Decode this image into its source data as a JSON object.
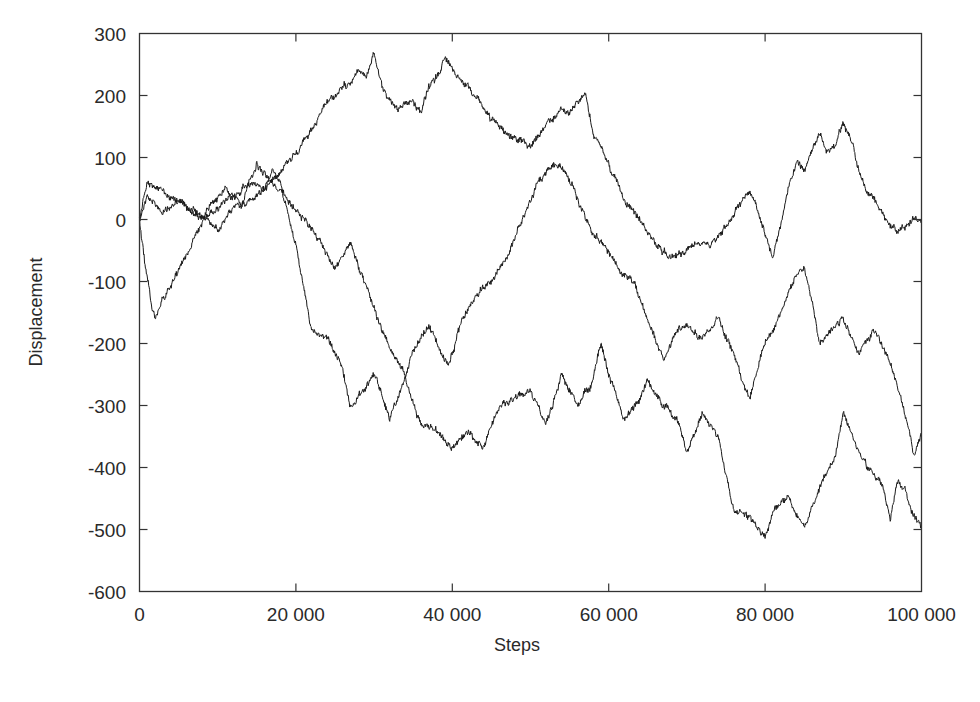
{
  "chart_data": {
    "type": "line",
    "title": "",
    "xlabel": "Steps",
    "ylabel": "Displacement",
    "xlim": [
      0,
      100000
    ],
    "ylim": [
      -600,
      300
    ],
    "grid": false,
    "legend": null,
    "x_ticks": [
      0,
      20000,
      40000,
      60000,
      80000,
      100000
    ],
    "x_tick_labels": [
      "0",
      "20 000",
      "40 000",
      "60 000",
      "80 000",
      "100 000"
    ],
    "y_ticks": [
      300,
      200,
      100,
      0,
      -100,
      -200,
      -300,
      -400,
      -500,
      -600
    ],
    "y_tick_labels": [
      "300",
      "200",
      "100",
      "0",
      "-100",
      "-200",
      "-300",
      "-400",
      "-500",
      "-600"
    ],
    "line_color": "#1a1a1a",
    "series": [
      {
        "name": "walk 1",
        "x": [
          0,
          1000,
          3000,
          5000,
          8000,
          10000,
          12000,
          14000,
          16000,
          18000,
          20000,
          22000,
          24000,
          26000,
          28000,
          29000,
          30000,
          31000,
          33000,
          35000,
          36000,
          37000,
          38000,
          39000,
          41000,
          43000,
          45000,
          48000,
          50000,
          52000,
          54000,
          55000,
          56000,
          57000,
          58000,
          60000,
          62000,
          64000,
          66000,
          68000,
          70000,
          72000,
          73000,
          75000,
          77000,
          78000,
          80000,
          81000,
          83000,
          84000,
          85000,
          87000,
          88000,
          89000,
          90000,
          91000,
          92000,
          93000,
          94000,
          96000,
          97000,
          99000,
          100000
        ],
        "values": [
          0,
          40,
          10,
          30,
          0,
          20,
          35,
          60,
          50,
          80,
          110,
          140,
          190,
          210,
          240,
          230,
          270,
          210,
          180,
          190,
          175,
          210,
          230,
          260,
          230,
          200,
          160,
          130,
          120,
          150,
          180,
          170,
          190,
          200,
          140,
          90,
          30,
          0,
          -40,
          -60,
          -50,
          -30,
          -40,
          -10,
          30,
          50,
          -20,
          -60,
          50,
          90,
          80,
          140,
          110,
          120,
          150,
          130,
          80,
          40,
          30,
          -10,
          -20,
          0,
          0
        ]
      },
      {
        "name": "walk 2",
        "x": [
          0,
          1000,
          2000,
          3000,
          5000,
          7000,
          9000,
          11000,
          13000,
          15000,
          17000,
          19000,
          21000,
          23000,
          25000,
          27000,
          29000,
          31000,
          33000,
          34000,
          35000,
          37000,
          38000,
          39500,
          41000,
          43000,
          45000,
          47000,
          49000,
          51000,
          53000,
          54500,
          56000,
          58000,
          60000,
          61500,
          63000,
          65000,
          67000,
          68500,
          70000,
          72000,
          74000,
          76000,
          78000,
          80000,
          82000,
          84000,
          85000,
          86000,
          87000,
          89000,
          90000,
          92000,
          94000,
          96000,
          97000,
          98000,
          99000,
          100000
        ],
        "values": [
          0,
          -100,
          -160,
          -130,
          -80,
          -30,
          20,
          50,
          20,
          90,
          60,
          30,
          0,
          -30,
          -80,
          -40,
          -110,
          -180,
          -230,
          -250,
          -210,
          -170,
          -200,
          -240,
          -170,
          -120,
          -100,
          -60,
          0,
          60,
          90,
          80,
          30,
          -20,
          -50,
          -90,
          -100,
          -160,
          -230,
          -180,
          -170,
          -190,
          -160,
          -220,
          -290,
          -200,
          -150,
          -90,
          -80,
          -130,
          -200,
          -170,
          -160,
          -220,
          -180,
          -230,
          -270,
          -320,
          -380,
          -350
        ]
      },
      {
        "name": "walk 3",
        "x": [
          0,
          1000,
          2000,
          4000,
          6000,
          8000,
          10000,
          12000,
          14000,
          16000,
          17000,
          18000,
          20000,
          22000,
          24000,
          26000,
          27000,
          29000,
          30000,
          32000,
          34000,
          36000,
          38000,
          40000,
          42000,
          44000,
          46000,
          48000,
          50000,
          52000,
          54000,
          56000,
          58000,
          59000,
          60000,
          62000,
          64000,
          65000,
          67000,
          69000,
          70000,
          72000,
          74000,
          76000,
          78000,
          80000,
          81000,
          83000,
          85000,
          87000,
          89000,
          90000,
          91000,
          93000,
          95000,
          96000,
          97000,
          98000,
          99000,
          100000
        ],
        "values": [
          0,
          60,
          50,
          40,
          20,
          10,
          -20,
          20,
          30,
          50,
          80,
          60,
          -40,
          -180,
          -190,
          -240,
          -300,
          -270,
          -250,
          -320,
          -260,
          -330,
          -340,
          -370,
          -340,
          -370,
          -300,
          -290,
          -280,
          -330,
          -250,
          -300,
          -260,
          -200,
          -250,
          -320,
          -290,
          -260,
          -300,
          -330,
          -380,
          -310,
          -350,
          -470,
          -480,
          -510,
          -470,
          -450,
          -500,
          -430,
          -380,
          -310,
          -350,
          -400,
          -430,
          -480,
          -420,
          -440,
          -480,
          -500
        ]
      }
    ]
  },
  "axes": {
    "xlabel": "Steps",
    "ylabel": "Displacement"
  }
}
